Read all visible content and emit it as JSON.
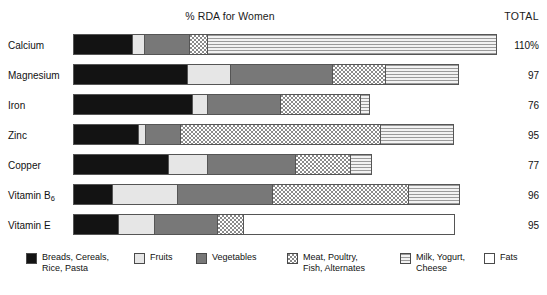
{
  "chart_data": {
    "type": "bar",
    "title": "% RDA for Women",
    "orientation": "horizontal",
    "stacked": true,
    "xlabel": "",
    "ylabel": "",
    "xlim": [
      0,
      110
    ],
    "grid": false,
    "legend_position": "bottom",
    "total_header": "TOTAL",
    "categories": [
      "Calcium",
      "Magnesium",
      "Iron",
      "Zinc",
      "Copper",
      "Vitamin B6",
      "Vitamin E"
    ],
    "series": [
      {
        "name": "Breads, Cereals, Rice, Pasta",
        "values": [
          14,
          27,
          28,
          15,
          22,
          9,
          11
        ]
      },
      {
        "name": "Fruits",
        "values": [
          3,
          10,
          4,
          2,
          9,
          15,
          9
        ]
      },
      {
        "name": "Vegetables",
        "values": [
          11,
          24,
          17,
          8,
          21,
          23,
          15
        ]
      },
      {
        "name": "Meat, Poultry, Fish, Alternates",
        "values": [
          4,
          13,
          19,
          48,
          13,
          32,
          6
        ]
      },
      {
        "name": "Milk, Yogurt, Cheese",
        "values": [
          68,
          17,
          2,
          17,
          5,
          12,
          0
        ]
      },
      {
        "name": "Fats",
        "values": [
          0,
          0,
          0,
          0,
          0,
          0,
          49
        ]
      }
    ],
    "totals": [
      "110%",
      "97",
      "76",
      "95",
      "77",
      "96",
      "95"
    ]
  },
  "header": {
    "title": "% RDA for Women",
    "total_label": "TOTAL"
  },
  "rows": [
    {
      "label": "Calcium",
      "label_sub": "",
      "total": "110%",
      "segments": [
        {
          "key": "breads",
          "width_px": 59
        },
        {
          "key": "fruits",
          "width_px": 12
        },
        {
          "key": "vegetables",
          "width_px": 45
        },
        {
          "key": "meat",
          "width_px": 18
        },
        {
          "key": "milk",
          "width_px": 288
        }
      ]
    },
    {
      "label": "Magnesium",
      "label_sub": "",
      "total": "97",
      "segments": [
        {
          "key": "breads",
          "width_px": 114
        },
        {
          "key": "fruits",
          "width_px": 43
        },
        {
          "key": "vegetables",
          "width_px": 102
        },
        {
          "key": "meat",
          "width_px": 53
        },
        {
          "key": "milk",
          "width_px": 72
        }
      ]
    },
    {
      "label": "Iron",
      "label_sub": "",
      "total": "76",
      "segments": [
        {
          "key": "breads",
          "width_px": 119
        },
        {
          "key": "fruits",
          "width_px": 15
        },
        {
          "key": "vegetables",
          "width_px": 73
        },
        {
          "key": "meat",
          "width_px": 80
        },
        {
          "key": "milk",
          "width_px": 8
        }
      ]
    },
    {
      "label": "Zinc",
      "label_sub": "",
      "total": "95",
      "segments": [
        {
          "key": "breads",
          "width_px": 65
        },
        {
          "key": "fruits",
          "width_px": 7
        },
        {
          "key": "vegetables",
          "width_px": 35
        },
        {
          "key": "meat",
          "width_px": 200
        },
        {
          "key": "milk",
          "width_px": 72
        }
      ]
    },
    {
      "label": "Copper",
      "label_sub": "",
      "total": "77",
      "segments": [
        {
          "key": "breads",
          "width_px": 95
        },
        {
          "key": "fruits",
          "width_px": 39
        },
        {
          "key": "vegetables",
          "width_px": 88
        },
        {
          "key": "meat",
          "width_px": 55
        },
        {
          "key": "milk",
          "width_px": 20
        }
      ]
    },
    {
      "label": "Vitamin B",
      "label_sub": "6",
      "total": "96",
      "segments": [
        {
          "key": "breads",
          "width_px": 39
        },
        {
          "key": "fruits",
          "width_px": 65
        },
        {
          "key": "vegetables",
          "width_px": 95
        },
        {
          "key": "meat",
          "width_px": 136
        },
        {
          "key": "milk",
          "width_px": 50
        }
      ]
    },
    {
      "label": "Vitamin E",
      "label_sub": "",
      "total": "95",
      "segments": [
        {
          "key": "breads",
          "width_px": 45
        },
        {
          "key": "fruits",
          "width_px": 36
        },
        {
          "key": "vegetables",
          "width_px": 63
        },
        {
          "key": "meat",
          "width_px": 26
        },
        {
          "key": "fats",
          "width_px": 210
        }
      ]
    }
  ],
  "legend": {
    "items": [
      {
        "key": "breads",
        "label": "Breads, Cereals,\nRice, Pasta",
        "left_px": 26
      },
      {
        "key": "fruits",
        "label": "Fruits",
        "left_px": 134
      },
      {
        "key": "vegetables",
        "label": "Vegetables",
        "left_px": 196
      },
      {
        "key": "meat",
        "label": "Meat, Poultry,\nFish, Alternates",
        "left_px": 287
      },
      {
        "key": "milk",
        "label": "Milk, Yogurt,\nCheese",
        "left_px": 400
      },
      {
        "key": "fats",
        "label": "Fats",
        "left_px": 484
      }
    ]
  },
  "colors": {
    "breads": "#131313",
    "fruits": "#e6e6e6",
    "vegetables": "#787878",
    "meat": "#8a8a8a",
    "milk": "#9a9a9a",
    "fats": "#ffffff",
    "outline": "#555555",
    "text": "#111111"
  }
}
